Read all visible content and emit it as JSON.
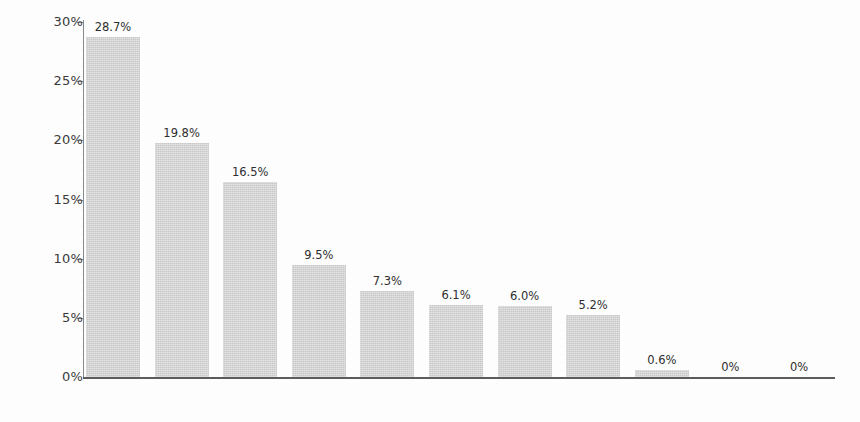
{
  "chart_data": {
    "type": "bar",
    "title": "",
    "subtitle": "",
    "xlabel": "",
    "ylabel": "",
    "grid": false,
    "legend": false,
    "ylim": [
      0,
      30
    ],
    "y_ticks": [
      "0%",
      "5%",
      "10%",
      "15%",
      "20%",
      "25%",
      "30%"
    ],
    "y_tick_values": [
      0,
      5,
      10,
      15,
      20,
      25,
      30
    ],
    "categories": [
      "CREON",
      "CHORUS",
      "ANTIGONE",
      "GUARD",
      "MESSENGER",
      "TIRESIAS",
      "HAEMON",
      "ISMENE",
      "EURYDICE",
      "BOY",
      "SERVANTS"
    ],
    "values": [
      28.7,
      19.8,
      16.5,
      9.5,
      7.3,
      6.1,
      6.0,
      5.2,
      0.6,
      0,
      0
    ],
    "data_labels": [
      "28.7%",
      "19.8%",
      "16.5%",
      "9.5%",
      "7.3%",
      "6.1%",
      "6.0%",
      "5.2%",
      "0.6%",
      "0%",
      "0%"
    ],
    "bar_color": "#c9c9c9",
    "axis_color": "#5c5c5c",
    "text_color": "#2e2e2e",
    "background_color": "#fdfdfd"
  }
}
